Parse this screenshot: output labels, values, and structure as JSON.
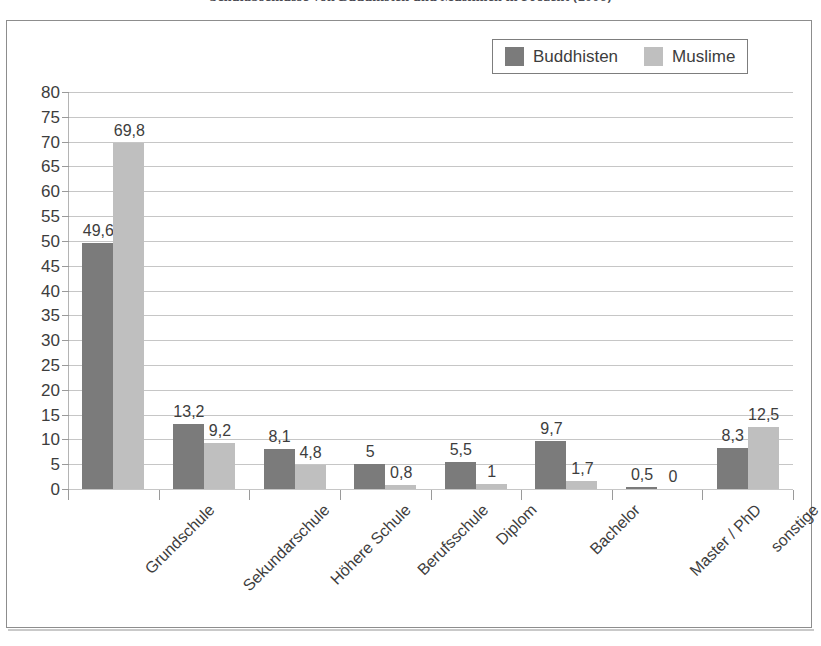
{
  "chart_data": {
    "type": "bar",
    "title": "Schulabschlüsse von Buddhisten und Muslimen in Prozent (2006)",
    "xlabel": "",
    "ylabel": "",
    "ylim": [
      0,
      80
    ],
    "ytick_step": 5,
    "yticks": [
      "80",
      "75",
      "70",
      "65",
      "60",
      "55",
      "50",
      "45",
      "40",
      "35",
      "30",
      "25",
      "20",
      "15",
      "10",
      "5",
      "0"
    ],
    "grid": true,
    "legend_position": "top-right",
    "decimal_separator": ",",
    "categories": [
      "Grundschule",
      "Sekundarschule",
      "Höhere Schule",
      "Berufsschule",
      "Diplom",
      "Bachelor",
      "Master / PhD",
      "sonstige"
    ],
    "series": [
      {
        "name": "Buddhisten",
        "color": "#7b7b7b",
        "values": [
          49.6,
          13.2,
          8.1,
          5,
          5.5,
          9.7,
          0.5,
          8.3
        ],
        "labels": [
          "49,6",
          "13,2",
          "8,1",
          "5",
          "5,5",
          "9,7",
          "0,5",
          "8,3"
        ]
      },
      {
        "name": "Muslime",
        "color": "#bfbfbf",
        "values": [
          69.8,
          9.2,
          4.8,
          0.8,
          1,
          1.7,
          0,
          12.5
        ],
        "labels": [
          "69,8",
          "9,2",
          "4,8",
          "0,8",
          "1",
          "1,7",
          "0",
          "12,5"
        ]
      }
    ]
  },
  "colors": {
    "buddhisten": "#7b7b7b",
    "muslime": "#bfbfbf",
    "gridline": "#c6c6c6",
    "frame": "#8d8d8d",
    "text": "#3d3d3d",
    "background": "#ffffff"
  }
}
